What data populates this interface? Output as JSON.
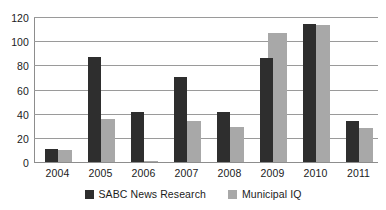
{
  "chart_data": {
    "type": "bar",
    "title": "",
    "xlabel": "",
    "ylabel": "",
    "categories": [
      "2004",
      "2005",
      "2006",
      "2007",
      "2008",
      "2009",
      "2010",
      "2011"
    ],
    "series": [
      {
        "name": "SABC News Research",
        "color": "#2e2e2e",
        "values": [
          11,
          87,
          41,
          70,
          41,
          86,
          114,
          34
        ]
      },
      {
        "name": "Municipal IQ",
        "color": "#a8a8a8",
        "values": [
          10,
          36,
          1,
          34,
          29,
          107,
          113,
          28
        ]
      }
    ],
    "ylim": [
      0,
      120
    ],
    "yticks": [
      0,
      20,
      40,
      60,
      80,
      100,
      120
    ],
    "ytick_labels": [
      "0",
      "20",
      "40",
      "60",
      "80",
      "100",
      "120"
    ],
    "grid": true,
    "grid_axis": "y",
    "legend_position": "bottom",
    "axis_color": "#8d8d8d",
    "gridline_color": "#9a9a9a",
    "background": "#ffffff"
  }
}
